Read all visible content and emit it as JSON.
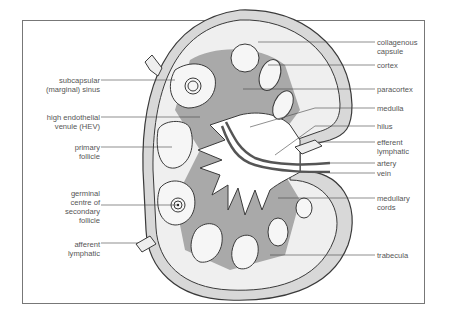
{
  "diagram": {
    "colors": {
      "capsule_fill": "#d8d8d8",
      "outline": "#3a3a3a",
      "paracortex_fill": "#a9a9a9",
      "follicle_fill": "#f4f4f4",
      "medulla_fill": "#ffffff",
      "vessel": "#555555",
      "label_text": "#555555",
      "leader_line": "#444444"
    },
    "labels_left": [
      {
        "id": "subcapsular-sinus",
        "line1": "subcapsular",
        "line2": "(marginal) sinus"
      },
      {
        "id": "hev",
        "line1": "high endothelial",
        "line2": "venule (HEV)"
      },
      {
        "id": "primary-follicle",
        "line1": "primary",
        "line2": "follicle"
      },
      {
        "id": "germinal-centre",
        "line1": "germinal",
        "line2": "centre of",
        "line3": "secondary",
        "line4": "follicle"
      },
      {
        "id": "afferent-lymphatic",
        "line1": "afferent",
        "line2": "lymphatic"
      }
    ],
    "labels_right": [
      {
        "id": "collagenous-capsule",
        "line1": "collagenous",
        "line2": "capsule"
      },
      {
        "id": "cortex",
        "line1": "cortex"
      },
      {
        "id": "paracortex",
        "line1": "paracortex"
      },
      {
        "id": "medulla",
        "line1": "medulla"
      },
      {
        "id": "hilus",
        "line1": "hilus"
      },
      {
        "id": "efferent-lymphatic",
        "line1": "efferent",
        "line2": "lymphatic"
      },
      {
        "id": "artery",
        "line1": "artery"
      },
      {
        "id": "vein",
        "line1": "vein"
      },
      {
        "id": "medullary-cords",
        "line1": "medullary",
        "line2": "cords"
      },
      {
        "id": "trabecula",
        "line1": "trabecula"
      }
    ]
  }
}
